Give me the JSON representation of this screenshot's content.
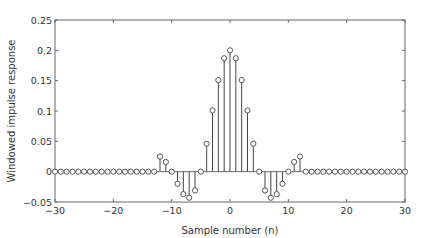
{
  "chart_data": {
    "type": "stem",
    "title": "",
    "xlabel": "Sample number (n)",
    "ylabel": "Windowed impulse response",
    "xlim": [
      -30,
      30
    ],
    "ylim": [
      -0.05,
      0.25
    ],
    "xticks": [
      -30,
      -20,
      -10,
      0,
      10,
      20,
      30
    ],
    "xtick_labels": [
      "−30",
      "−20",
      "−10",
      "0",
      "10",
      "20",
      "30"
    ],
    "yticks": [
      -0.05,
      0,
      0.05,
      0.1,
      0.15,
      0.2,
      0.25
    ],
    "ytick_labels": [
      "−0.05",
      "0",
      "0.05",
      "0.1",
      "0.15",
      "0.2",
      "0.25"
    ],
    "grid": false,
    "legend": null,
    "x": [
      -30,
      -29,
      -28,
      -27,
      -26,
      -25,
      -24,
      -23,
      -22,
      -21,
      -20,
      -19,
      -18,
      -17,
      -16,
      -15,
      -14,
      -13,
      -12,
      -11,
      -10,
      -9,
      -8,
      -7,
      -6,
      -5,
      -4,
      -3,
      -2,
      -1,
      0,
      1,
      2,
      3,
      4,
      5,
      6,
      7,
      8,
      9,
      10,
      11,
      12,
      13,
      14,
      15,
      16,
      17,
      18,
      19,
      20,
      21,
      22,
      23,
      24,
      25,
      26,
      27,
      28,
      29,
      30
    ],
    "values": [
      0,
      0,
      0,
      0,
      0,
      0,
      0,
      0,
      0,
      0,
      0,
      0,
      0,
      0,
      0,
      0,
      0,
      0,
      0.025,
      0.016,
      0,
      -0.02,
      -0.037,
      -0.043,
      -0.031,
      0,
      0.046,
      0.101,
      0.151,
      0.187,
      0.2,
      0.187,
      0.151,
      0.101,
      0.046,
      0,
      -0.031,
      -0.043,
      -0.037,
      -0.02,
      0,
      0.016,
      0.025,
      0,
      0,
      0,
      0,
      0,
      0,
      0,
      0,
      0,
      0,
      0,
      0,
      0,
      0,
      0,
      0,
      0,
      0
    ],
    "marker": "circle-open",
    "color": "#444444"
  }
}
